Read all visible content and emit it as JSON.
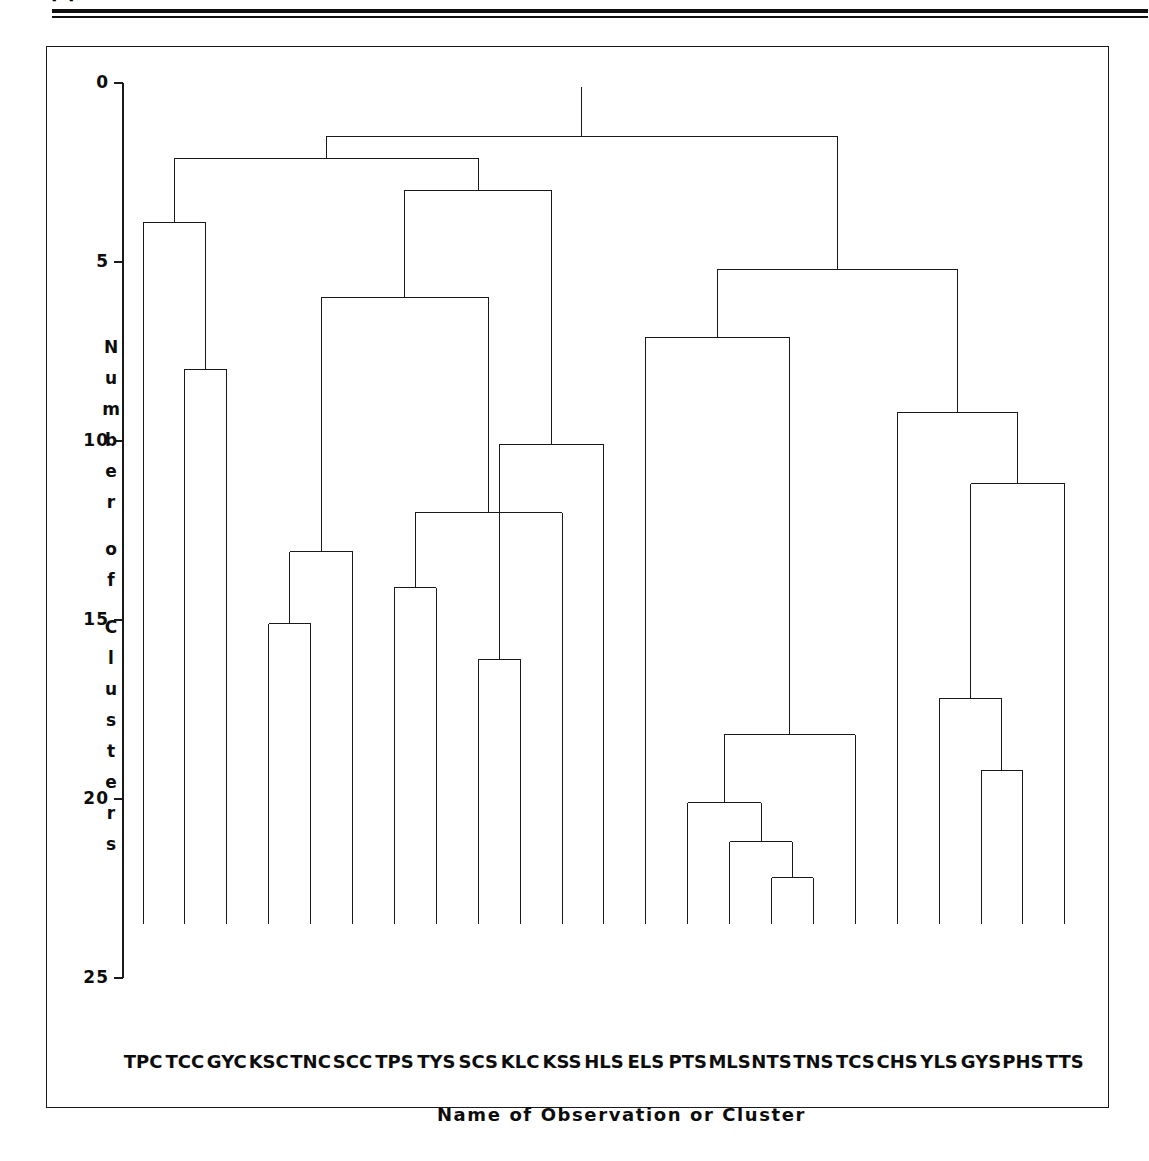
{
  "page": {
    "background_color": "#ffffff",
    "ink_color": "#111111",
    "scan_fragment_text": "[3]"
  },
  "chart_data": {
    "type": "dendrogram",
    "title": "",
    "xlabel": "Name of Observation or Cluster",
    "ylabel": "Number of Clusters",
    "yticks": [
      0,
      5,
      10,
      15,
      20,
      25
    ],
    "ytick_labels": [
      "0",
      "5",
      "10",
      "15",
      "20",
      "25"
    ],
    "ylim": [
      0,
      25
    ],
    "y_axis_inverted": true,
    "grid": false,
    "legend": null,
    "line_color": "#1a1a1a",
    "n_leaves": 23,
    "leaf_baseline": 23.5,
    "leaves": [
      "TPC",
      "TCC",
      "GYC",
      "KSC",
      "TNC",
      "SCC",
      "TPS",
      "TYS",
      "SCS",
      "KLC",
      "KSS",
      "HLS",
      "ELS",
      "PTS",
      "MLS",
      "NTS",
      "TNS",
      "TCS",
      "CHS",
      "YLS",
      "GYS",
      "PHS",
      "TTS"
    ],
    "merges": [
      {
        "id": "m1",
        "height": 22.2,
        "left": "NTS",
        "right": "TNS"
      },
      {
        "id": "m2",
        "height": 21.2,
        "left": "MLS",
        "right": "m1"
      },
      {
        "id": "m3",
        "height": 20.1,
        "left": "PTS",
        "right": "m2"
      },
      {
        "id": "m4",
        "height": 19.2,
        "left": "GYS",
        "right": "PHS"
      },
      {
        "id": "m5",
        "height": 18.2,
        "left": "m3",
        "right": "TCS"
      },
      {
        "id": "m6",
        "height": 17.2,
        "left": "YLS",
        "right": "m4"
      },
      {
        "id": "m7",
        "height": 16.1,
        "left": "SCS",
        "right": "KLC"
      },
      {
        "id": "m8",
        "height": 15.1,
        "left": "KSC",
        "right": "TNC"
      },
      {
        "id": "m9",
        "height": 14.1,
        "left": "TPS",
        "right": "TYS"
      },
      {
        "id": "m10",
        "height": 13.1,
        "left": "m8",
        "right": "SCC"
      },
      {
        "id": "m11",
        "height": 12.0,
        "left": "m9",
        "right": "KSS"
      },
      {
        "id": "m12",
        "height": 11.2,
        "left": "m6",
        "right": "TTS"
      },
      {
        "id": "m13",
        "height": 10.1,
        "left": "m7",
        "right": "HLS"
      },
      {
        "id": "m14",
        "height": 9.2,
        "left": "m12",
        "right": "CHS"
      },
      {
        "id": "m15",
        "height": 8.0,
        "left": "TCC",
        "right": "GYC"
      },
      {
        "id": "m16",
        "height": 7.1,
        "left": "ELS",
        "right": "m5"
      },
      {
        "id": "m17",
        "height": 6.0,
        "left": "m10",
        "right": "m11"
      },
      {
        "id": "m18",
        "height": 5.2,
        "left": "m16",
        "right": "m14"
      },
      {
        "id": "m19",
        "height": 3.9,
        "left": "TPC",
        "right": "m15"
      },
      {
        "id": "m20",
        "height": 3.0,
        "left": "m17",
        "right": "m13"
      },
      {
        "id": "m21",
        "height": 2.1,
        "left": "m19",
        "right": "m20"
      },
      {
        "id": "m22",
        "height": 1.5,
        "left": "m21",
        "right": "m18"
      }
    ]
  },
  "axes": {
    "y_title_chars": [
      "N",
      "u",
      "m",
      "b",
      "e",
      "r",
      "",
      "o",
      "f",
      "",
      "C",
      "l",
      "u",
      "s",
      "t",
      "e",
      "r",
      "s"
    ]
  }
}
